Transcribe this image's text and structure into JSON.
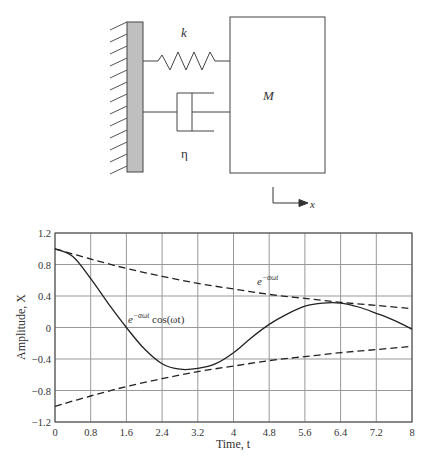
{
  "diagram": {
    "spring_label": "k",
    "damper_label": "η",
    "mass_label": "M",
    "axis_label": "x",
    "wall_color": "#bfbfbf"
  },
  "chart_data": {
    "type": "line",
    "title": "",
    "xlabel": "Time, t",
    "ylabel": "Amplitude, X",
    "xlim": [
      0,
      8
    ],
    "ylim": [
      -1.2,
      1.2
    ],
    "grid": true,
    "x_ticks": [
      "0",
      "0.8",
      "1.6",
      "2.4",
      "3.2",
      "4",
      "4.8",
      "5.6",
      "6.4",
      "7.2",
      "8"
    ],
    "y_ticks": [
      "1.2",
      "0.8",
      "0.4",
      "0",
      "-0.4",
      "-0.8",
      "-1.2"
    ],
    "annotations": [
      {
        "text_base": "e",
        "text_sup": "−αωt",
        "label": "upper envelope",
        "x": 5.1,
        "y": 0.52
      },
      {
        "text_base": "e",
        "text_sup": "−αωt",
        "text_tail": " cos(ωt)",
        "label": "damped oscillation",
        "x": 2.4,
        "y": 0.1
      }
    ],
    "series": [
      {
        "name": "e^(-αωt)",
        "style": "dashed",
        "x": [
          0,
          0.8,
          1.6,
          2.4,
          3.2,
          4,
          4.8,
          5.6,
          6.4,
          7.2,
          8
        ],
        "values": [
          1.0,
          0.87,
          0.75,
          0.65,
          0.56,
          0.49,
          0.42,
          0.37,
          0.32,
          0.28,
          0.24
        ]
      },
      {
        "name": "-e^(-αωt)",
        "style": "dashed",
        "x": [
          0,
          0.8,
          1.6,
          2.4,
          3.2,
          4,
          4.8,
          5.6,
          6.4,
          7.2,
          8
        ],
        "values": [
          -1.0,
          -0.87,
          -0.75,
          -0.65,
          -0.56,
          -0.49,
          -0.42,
          -0.37,
          -0.32,
          -0.28,
          -0.24
        ]
      },
      {
        "name": "e^(-αωt) cos(ωt)",
        "style": "solid",
        "x": [
          0,
          0.4,
          0.8,
          1.2,
          1.6,
          2.0,
          2.4,
          2.8,
          3.2,
          3.6,
          4.0,
          4.4,
          4.8,
          5.2,
          5.6,
          6.0,
          6.4,
          6.8,
          7.2,
          7.6,
          8.0
        ],
        "values": [
          1.0,
          0.9,
          0.62,
          0.3,
          0.0,
          -0.27,
          -0.46,
          -0.53,
          -0.52,
          -0.46,
          -0.32,
          -0.13,
          0.04,
          0.17,
          0.27,
          0.31,
          0.31,
          0.26,
          0.18,
          0.09,
          -0.02
        ]
      }
    ]
  }
}
